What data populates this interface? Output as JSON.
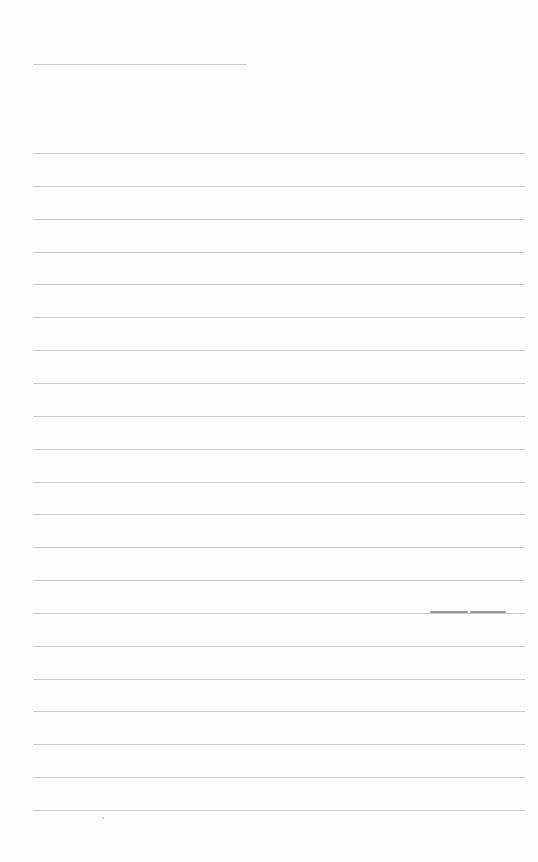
{
  "page": {
    "type": "lined-paper",
    "background_color": "#fefefe",
    "line_color": "#cacaca",
    "header_line": {
      "x": 33,
      "y": 64,
      "width": 213
    },
    "rules": {
      "x": 33,
      "width": 492,
      "first_y": 153,
      "spacing": 32.85,
      "count": 21
    },
    "ink_marks": [
      {
        "x": 430,
        "y": 611,
        "width": 38
      },
      {
        "x": 470,
        "y": 611,
        "width": 36
      }
    ],
    "specks": [
      {
        "x": 102,
        "y": 817
      }
    ]
  }
}
